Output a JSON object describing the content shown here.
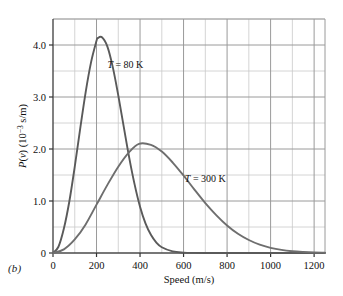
{
  "figure": {
    "panel_label": "(b)"
  },
  "chart_data": {
    "type": "line",
    "title": "",
    "subtitle": "",
    "xlabel": "Speed (m/s)",
    "ylabel": "P(v)  (10^-3 s/m)",
    "ylabel_parts": {
      "p": "P",
      "v": "(v)",
      "unit_open": " (10",
      "exponent": "−3",
      "unit_close": " s/m)"
    },
    "xlim": [
      0,
      1250
    ],
    "ylim": [
      0,
      4.5
    ],
    "xticks": [
      0,
      200,
      400,
      600,
      800,
      1000,
      1200
    ],
    "xtick_labels": [
      "0",
      "200",
      "400",
      "600",
      "800",
      "1000",
      "1200"
    ],
    "yticks": [
      0,
      1.0,
      2.0,
      3.0,
      4.0
    ],
    "ytick_labels": [
      "0",
      "1.0",
      "2.0",
      "3.0",
      "4.0"
    ],
    "x_minor_step": 100,
    "y_minor_step": 0.5,
    "grid": true,
    "grid_major_color": "#9a9a9a",
    "grid_minor_color": "#c9c9c9",
    "frame_color": "#4a4a4a",
    "legend_position": "inline-annotations",
    "series": [
      {
        "name": "T = 80 K",
        "label_parts": {
          "symbol": "T",
          "equals": " = ",
          "value": "80 K"
        },
        "color": "#5a5a5a",
        "peak_x": 205,
        "peak_y": 4.15,
        "annotation_x": 250,
        "annotation_y": 3.55,
        "x": [
          0,
          25,
          50,
          75,
          100,
          125,
          150,
          175,
          200,
          205,
          225,
          250,
          275,
          300,
          325,
          350,
          375,
          400,
          425,
          450,
          475,
          500,
          550,
          600,
          650,
          700,
          800,
          900,
          1000,
          1100,
          1200,
          1250
        ],
        "y": [
          0.0,
          0.12,
          0.47,
          0.99,
          1.66,
          2.39,
          3.09,
          3.67,
          4.08,
          4.13,
          4.15,
          3.97,
          3.57,
          3.03,
          2.43,
          1.84,
          1.32,
          0.89,
          0.57,
          0.35,
          0.2,
          0.11,
          0.03,
          0.008,
          0.002,
          0.0005,
          0.0,
          0.0,
          0.0,
          0.0,
          0.0,
          0.0
        ]
      },
      {
        "name": "T = 300 K",
        "label_parts": {
          "symbol": "T",
          "equals": " = ",
          "value": "300 K"
        },
        "color": "#6e6e6e",
        "peak_x": 395,
        "peak_y": 2.1,
        "annotation_x": 700,
        "annotation_y": 1.37,
        "x": [
          0,
          50,
          100,
          150,
          200,
          250,
          300,
          350,
          395,
          450,
          500,
          550,
          600,
          650,
          700,
          750,
          800,
          850,
          900,
          950,
          1000,
          1050,
          1100,
          1150,
          1200,
          1250
        ],
        "y": [
          0.0,
          0.07,
          0.26,
          0.55,
          0.93,
          1.31,
          1.66,
          1.94,
          2.1,
          2.08,
          1.95,
          1.74,
          1.49,
          1.22,
          0.96,
          0.73,
          0.53,
          0.37,
          0.25,
          0.16,
          0.1,
          0.06,
          0.035,
          0.02,
          0.01,
          0.006
        ]
      }
    ]
  }
}
